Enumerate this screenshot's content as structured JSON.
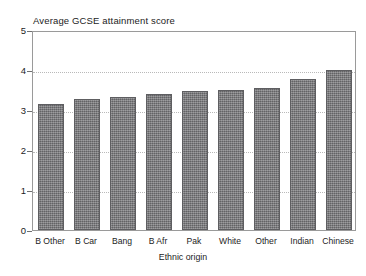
{
  "chart_data": {
    "type": "bar",
    "title": "Average GCSE attainment score",
    "xlabel": "Ethnic origin",
    "ylabel": "",
    "categories": [
      "B Other",
      "B Car",
      "Bang",
      "B Afr",
      "Pak",
      "White",
      "Other",
      "Indian",
      "Chinese"
    ],
    "values": [
      3.15,
      3.28,
      3.33,
      3.4,
      3.48,
      3.5,
      3.55,
      3.78,
      4.0
    ],
    "ylim": [
      0,
      5
    ],
    "yticks": [
      0,
      1,
      2,
      3,
      4,
      5
    ],
    "ytick_labels": [
      "0",
      "1",
      "2",
      "3",
      "4",
      "5"
    ],
    "grid": true,
    "grid_axis": "y",
    "legend": false,
    "legend_position": "none",
    "bar_color": "#77777a",
    "bar_edge_color": "#5e5e61",
    "grid_color": "#b9b9b9",
    "frame_color": "#9a9a9a",
    "background_color": "#ffffff"
  }
}
